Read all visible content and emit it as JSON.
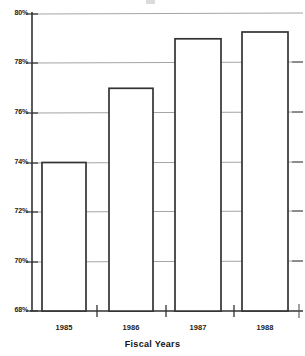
{
  "chart_data": {
    "type": "bar",
    "title": "",
    "xlabel": "Fiscal Years",
    "ylabel": "",
    "categories": [
      "1985",
      "1986",
      "1987",
      "1988"
    ],
    "values": [
      72,
      74,
      77,
      79
    ],
    "ylim": [
      68,
      80
    ],
    "ytick_values": [
      68,
      70,
      72,
      74,
      76,
      78,
      80
    ],
    "ytick_labels": [
      "68%",
      "70%",
      "72%",
      "74%",
      "76%",
      "78%",
      "80%"
    ],
    "value_unit": "%",
    "grid": true,
    "legend": null,
    "series": [
      {
        "name": "Fiscal Year Value",
        "values": [
          72,
          74,
          77,
          79
        ]
      }
    ],
    "bar_fill_color": "#ffffff",
    "bar_edge_color": "#333333",
    "grid_color": "#9a9a9a",
    "axis_color": "#333333"
  },
  "axis": {
    "x_title": "Fiscal Years"
  },
  "ytick_labels": {
    "t80": "80%",
    "t78": "78%",
    "t76": "76%",
    "t74": "74%",
    "t72": "72%",
    "t70": "70%",
    "t68": "68%"
  },
  "xtick_labels": {
    "c0": "1985",
    "c1": "1986",
    "c2": "1987",
    "c3": "1988"
  }
}
